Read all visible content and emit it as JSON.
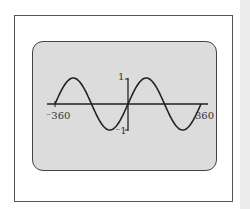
{
  "chart_data": {
    "type": "line",
    "title": "",
    "function": "y = sin(x)",
    "xlabel": "",
    "ylabel": "",
    "xlim": [
      -360,
      360
    ],
    "ylim": [
      -1,
      1
    ],
    "x_tick_labels": [
      "-360",
      "360"
    ],
    "y_tick_labels": [
      "1",
      "-1"
    ],
    "grid": false,
    "series": [
      {
        "name": "sin x",
        "x": [
          -360,
          -270,
          -180,
          -90,
          0,
          90,
          180,
          270,
          360
        ],
        "values": [
          0,
          1,
          0,
          -1,
          0,
          1,
          0,
          -1,
          0
        ]
      }
    ]
  },
  "labels": {
    "xmin": "⁻360",
    "xmax": "360",
    "ymax": "1",
    "ymin": "⁻1"
  },
  "colors": {
    "screen": "#dcdcdc",
    "curve": "#222222"
  }
}
